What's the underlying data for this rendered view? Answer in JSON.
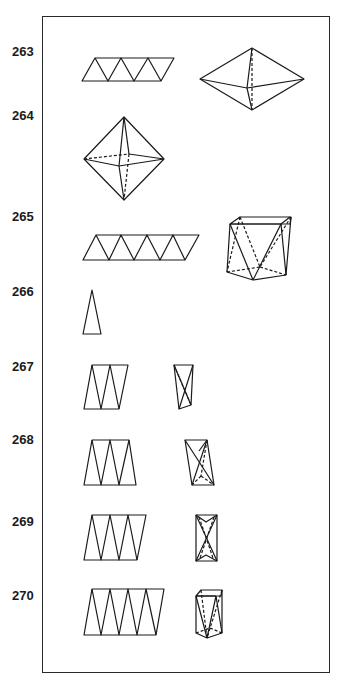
{
  "figure": {
    "type": "polyhedra nets and solids (antiprism family)",
    "colors": {
      "line": "#1a1a1a",
      "frame": "#2a2a2a",
      "background": "#ffffff"
    }
  },
  "rows": [
    {
      "number": "263",
      "net": "strip of 6 triangles",
      "solid": "triangular dipyramid (side view)"
    },
    {
      "number": "264",
      "net": "",
      "solid": "octahedron (square dipyramid)"
    },
    {
      "number": "265",
      "net": "strip of 8 triangles",
      "solid": "square antiprism"
    },
    {
      "number": "266",
      "net": "single thin isosceles triangle",
      "solid": ""
    },
    {
      "number": "267",
      "net": "strip of 4 tall triangles",
      "solid": "thin tetrahedron"
    },
    {
      "number": "268",
      "net": "strip of 5 tall triangles",
      "solid": "tall triangular antiprism fragment"
    },
    {
      "number": "269",
      "net": "strip of 6 tall triangles",
      "solid": "tall triangular antiprism"
    },
    {
      "number": "270",
      "net": "strip of 8 tall triangles",
      "solid": "tall square antiprism"
    }
  ]
}
